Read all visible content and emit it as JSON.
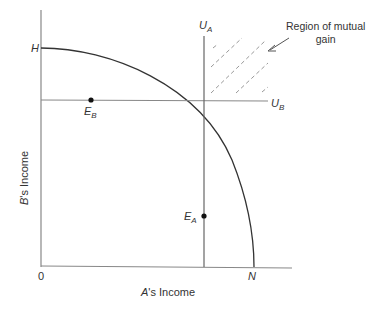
{
  "diagram": {
    "title": "",
    "x_axis_label_letter": "A",
    "x_axis_label_rest": "'s Income",
    "y_axis_label_letter": "B",
    "y_axis_label_rest": "'s Income",
    "origin_label": "0",
    "curve_top_label": "H",
    "curve_bottom_label": "N",
    "ua_label": "U",
    "ua_sub": "A",
    "ub_label": "U",
    "ub_sub": "B",
    "ea_label": "E",
    "ea_sub": "A",
    "eb_label": "E",
    "eb_sub": "B",
    "annotation_line1": "Region of mutual",
    "annotation_line2": "gain",
    "colors": {
      "axis": "#777777",
      "curve": "#333333",
      "hatch": "#999999",
      "text": "#333333"
    }
  }
}
